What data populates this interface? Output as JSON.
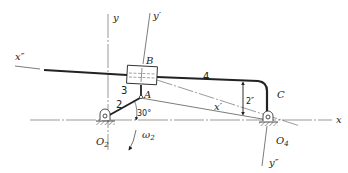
{
  "figure": {
    "type": "slider-crank mechanism diagram",
    "axes": {
      "x": "x",
      "y": "y",
      "x_prime": "x′",
      "y_prime": "y′",
      "x_double_prime": "x″",
      "y_double_prime": "y″"
    },
    "points": {
      "A": "A",
      "B": "B",
      "C": "C",
      "O2": "O",
      "O2_sub": "2",
      "O4": "O",
      "O4_sub": "4"
    },
    "links": {
      "link2": "2",
      "link3": "3",
      "link4": "4"
    },
    "annotations": {
      "angle": "30°",
      "offset": "2″",
      "omega": "ω",
      "omega_sub": "2"
    },
    "colors": {
      "line": "#222222",
      "thin_line": "#555555",
      "background": "#ffffff"
    }
  }
}
